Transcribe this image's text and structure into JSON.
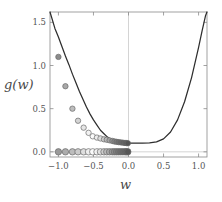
{
  "chart_data": {
    "type": "line",
    "title": "",
    "xlabel": "w",
    "ylabel": "g(w)",
    "xlim": [
      -1.12,
      1.12
    ],
    "ylim": [
      -0.06,
      1.62
    ],
    "grid": false,
    "legend": null,
    "xticks": [
      -1.0,
      -0.5,
      0.0,
      0.5,
      1.0
    ],
    "xticklabels": [
      "-1.0",
      "-0.5",
      "0.0",
      "0.5",
      "1.0"
    ],
    "yticks": [
      0.0,
      0.5,
      1.0,
      1.5
    ],
    "yticklabels": [
      "0.0",
      "0.5",
      "1.0",
      "1.5"
    ],
    "vertical_reference_line_x": 0.0,
    "horizontal_reference_line_y": 0.0,
    "series": [
      {
        "name": "g(w)",
        "type": "line",
        "color": "#2e2e2e",
        "x": [
          -1.12,
          -1.05,
          -1.0,
          -0.95,
          -0.9,
          -0.85,
          -0.8,
          -0.75,
          -0.7,
          -0.65,
          -0.6,
          -0.55,
          -0.5,
          -0.45,
          -0.4,
          -0.35,
          -0.3,
          -0.25,
          -0.2,
          -0.15,
          -0.1,
          -0.05,
          0.0,
          0.1,
          0.2,
          0.3,
          0.4,
          0.5,
          0.6,
          0.7,
          0.8,
          0.9,
          1.0,
          1.05,
          1.1,
          1.12
        ],
        "y": [
          1.62,
          1.43,
          1.33,
          1.22,
          1.11,
          1.01,
          0.9,
          0.8,
          0.7,
          0.61,
          0.52,
          0.44,
          0.37,
          0.31,
          0.25,
          0.21,
          0.17,
          0.145,
          0.125,
          0.112,
          0.105,
          0.101,
          0.1,
          0.1,
          0.101,
          0.104,
          0.115,
          0.15,
          0.23,
          0.37,
          0.58,
          0.86,
          1.21,
          1.4,
          1.58,
          1.62
        ]
      },
      {
        "name": "gradient descent steps on curve",
        "type": "scatter",
        "marker": "circle",
        "x": [
          -1.0,
          -0.9,
          -0.8,
          -0.72,
          -0.64,
          -0.57,
          -0.51,
          -0.45,
          -0.4,
          -0.35,
          -0.31,
          -0.27,
          -0.23,
          -0.2,
          -0.17,
          -0.14,
          -0.11,
          -0.08,
          -0.05,
          -0.03,
          -0.01
        ],
        "y": [
          1.1,
          0.76,
          0.5,
          0.36,
          0.28,
          0.22,
          0.18,
          0.165,
          0.155,
          0.145,
          0.14,
          0.133,
          0.126,
          0.12,
          0.116,
          0.112,
          0.109,
          0.106,
          0.103,
          0.101,
          0.1
        ],
        "fill_ramp": [
          "#8c8c8c",
          "#a8a8a8",
          "#bdbdbd",
          "#d4d4d4",
          "#e6e6e6",
          "#f2f2f2",
          "#fafafa",
          "#ededed",
          "#dcdcdc",
          "#c9c9c9",
          "#b6b6b6",
          "#a3a3a3",
          "#949494",
          "#868686",
          "#7a7a7a",
          "#707070",
          "#686868",
          "#626262",
          "#5c5c5c",
          "#585858",
          "#545454"
        ]
      },
      {
        "name": "gradient descent steps on w-axis",
        "type": "scatter",
        "marker": "circle",
        "y_value": 0.0,
        "x": [
          -1.0,
          -0.9,
          -0.8,
          -0.72,
          -0.64,
          -0.57,
          -0.51,
          -0.45,
          -0.4,
          -0.35,
          -0.31,
          -0.27,
          -0.23,
          -0.2,
          -0.17,
          -0.14,
          -0.11,
          -0.08,
          -0.05,
          -0.03,
          -0.01
        ],
        "fill_ramp": [
          "#9a9a9a",
          "#acacac",
          "#bcbcbc",
          "#cccccc",
          "#dedede",
          "#eeeeee",
          "#fbfbfb",
          "#f2f2f2",
          "#e0e0e0",
          "#cdcdcd",
          "#bababa",
          "#a7a7a7",
          "#989898",
          "#8a8a8a",
          "#7e7e7e",
          "#747474",
          "#6c6c6c",
          "#656565",
          "#5f5f5f",
          "#5a5a5a",
          "#565656"
        ]
      }
    ],
    "colors": {
      "curve": "#2e2e2e",
      "frame": "#8a8a8a",
      "reference_line": "#c9c9c9",
      "marker_edge": "#6a6a6a",
      "tick_text": "#555555"
    }
  },
  "axes": {
    "x_label": "w",
    "y_label": "g(w)"
  }
}
